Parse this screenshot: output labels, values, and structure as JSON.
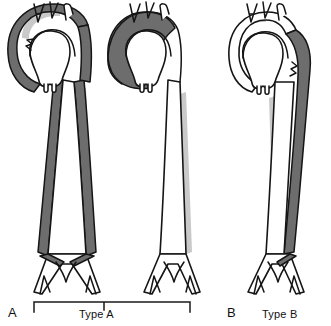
{
  "figure": {
    "panels": [
      {
        "letter": "A",
        "caption": "Type A",
        "diagram_count": 2,
        "description": "Dissection involving the ascending aorta"
      },
      {
        "letter": "B",
        "caption": "Type B",
        "diagram_count": 1,
        "description": "Dissection not involving the ascending aorta"
      }
    ],
    "colors": {
      "false_lumen": "#6d6d6d",
      "true_lumen": "#ffffff",
      "outline": "#151515",
      "shadow": "#c9c9c9",
      "background": "#ffffff"
    },
    "diagrams": [
      {
        "index": 1,
        "name": "aorta-dissection-extensive",
        "dissection_extent": "ascending aorta, arch and entire descending aorta to bifurcation"
      },
      {
        "index": 2,
        "name": "aorta-dissection-ascending-only",
        "dissection_extent": "ascending aorta and arch only"
      },
      {
        "index": 3,
        "name": "aorta-dissection-descending-only",
        "dissection_extent": "descending aorta distal to left subclavian artery"
      }
    ],
    "anatomy_parts": [
      "aortic-root",
      "ascending-aorta",
      "aortic-arch",
      "brachiocephalic-trunk",
      "left-common-carotid-artery",
      "left-subclavian-artery",
      "descending-thoracic-aorta",
      "abdominal-aorta",
      "aortic-bifurcation",
      "common-iliac-arteries"
    ]
  }
}
